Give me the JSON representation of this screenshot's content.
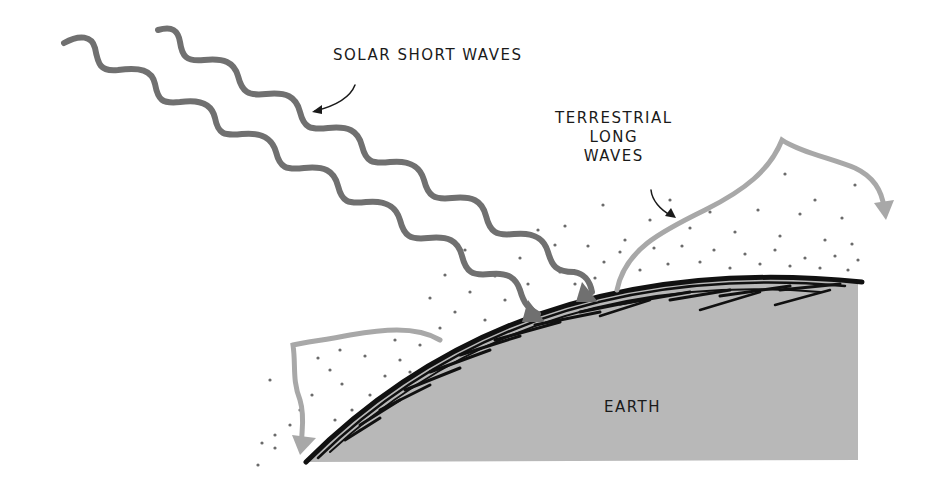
{
  "diagram": {
    "labels": {
      "solar": "SOLAR SHORT WAVES",
      "terrestrial_line1": "TERRESTRIAL",
      "terrestrial_line2": "LONG",
      "terrestrial_line3": "WAVES",
      "earth": "EARTH"
    },
    "colors": {
      "background": "#ffffff",
      "solar_wave": "#707070",
      "terrestrial_wave": "#a8a8a8",
      "earth_fill": "#b8b8b8",
      "atmosphere_edge": "#111111",
      "dots": "#6a6a6a",
      "text": "#1a1a1a"
    }
  }
}
